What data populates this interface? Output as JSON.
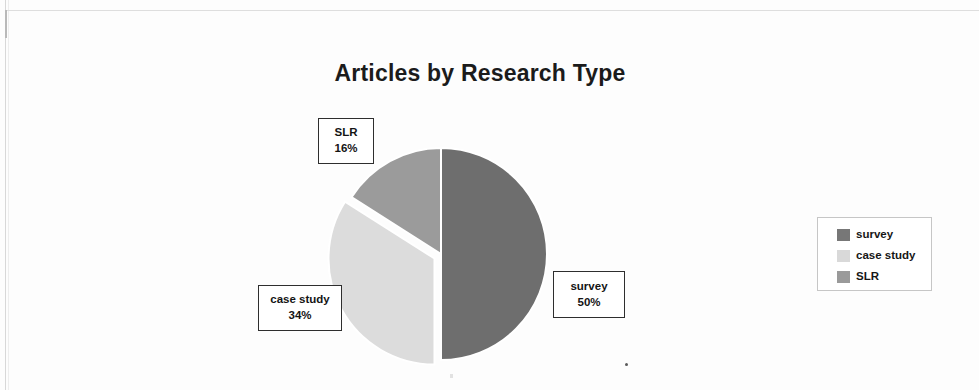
{
  "chart_data": {
    "type": "pie",
    "title": "Articles by Research Type",
    "categories": [
      "survey",
      "case study",
      "SLR"
    ],
    "values": [
      50,
      34,
      16
    ],
    "value_unit": "%",
    "labels": [
      "survey\n50%",
      "case study\n34%",
      "SLR\n16%"
    ],
    "colors": [
      "#6e6e6e",
      "#dcdcdc",
      "#9b9b9b"
    ],
    "legend_position": "right",
    "grid": false,
    "start_angle_deg": 0,
    "exploded_slice": "case study",
    "slices": [
      {
        "name": "survey",
        "percent": "50%",
        "percent_value": 50,
        "color": "#6e6e6e"
      },
      {
        "name": "case study",
        "percent": "34%",
        "percent_value": 34,
        "color": "#dcdcdc"
      },
      {
        "name": "SLR",
        "percent": "16%",
        "percent_value": 16,
        "color": "#9b9b9b"
      }
    ]
  },
  "title": "Articles by Research Type",
  "callouts": {
    "slr": {
      "name": "SLR",
      "percent": "16%"
    },
    "case_study": {
      "name": "case study",
      "percent": "34%"
    },
    "survey": {
      "name": "survey",
      "percent": "50%"
    }
  },
  "legend": {
    "items": [
      {
        "label": "survey",
        "color": "#777777"
      },
      {
        "label": "case study",
        "color": "#d9d9d9"
      },
      {
        "label": "SLR",
        "color": "#9a9a9a"
      }
    ]
  }
}
